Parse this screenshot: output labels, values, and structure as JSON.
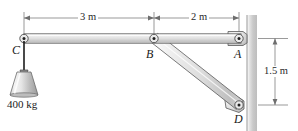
{
  "figure": {
    "background_color": "#ffffff",
    "width": 298,
    "height": 131
  },
  "labels": {
    "point_c": "C",
    "point_b": "B",
    "point_a": "A",
    "point_d": "D"
  },
  "dimensions": {
    "span_cb": "3 m",
    "span_ba": "2 m",
    "height_ad": "1.5 m"
  },
  "load": {
    "mass": "400 kg"
  },
  "geometry": {
    "point_c": {
      "x": 24,
      "y": 38.5
    },
    "point_b": {
      "x": 154,
      "y": 38.5
    },
    "point_a": {
      "x": 239,
      "y": 38.5
    },
    "point_d": {
      "x": 239,
      "y": 105
    },
    "beam_half_thickness": 5,
    "strut_half_thickness": 4.5,
    "wall_x_left": 247,
    "wall_x_right": 257,
    "dim_line_y": 18,
    "dim_line_x": 275
  },
  "colors": {
    "member_fill_light": "#f3f3f3",
    "member_fill_mid": "#d6d6d6",
    "member_fill_dark": "#b8b8b8",
    "member_stroke": "#5a5a5a",
    "wall_light": "#ffffff",
    "wall_dark": "#b9b9b9",
    "dimension_stroke": "#6e6e6e",
    "pin_stroke": "#4a4a4a",
    "pin_center": "#202020",
    "cable_stroke": "#1c1c1c",
    "weight_fill_light": "#f2f2f2",
    "weight_fill_dark": "#9e9e9e",
    "text": "#1a1a1a"
  }
}
